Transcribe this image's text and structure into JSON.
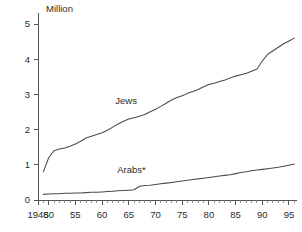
{
  "chart_data": {
    "type": "line",
    "title": "",
    "subtitle": "",
    "unit_label": "Million",
    "xlabel": "",
    "ylabel": "",
    "xlim": [
      1948,
      1996.5
    ],
    "ylim": [
      0,
      5.2
    ],
    "grid": false,
    "legend_position": "inline-annotations",
    "y_ticks": [
      0,
      1,
      2,
      3,
      4,
      5
    ],
    "y_tick_labels": [
      "0",
      "1",
      "2",
      "3",
      "4",
      "5"
    ],
    "x_ticks": [
      1948,
      1950,
      1955,
      1960,
      1965,
      1970,
      1975,
      1980,
      1985,
      1990,
      1995
    ],
    "x_tick_labels": [
      "1948",
      "50",
      "55",
      "60",
      "65",
      "70",
      "75",
      "80",
      "85",
      "90",
      "95"
    ],
    "x_minor_tick_step": 1,
    "series": [
      {
        "name": "Jews",
        "label": "Jews",
        "color": "#4a4a4a",
        "x": [
          1949,
          1950,
          1951,
          1952,
          1953,
          1954,
          1955,
          1956,
          1957,
          1958,
          1959,
          1960,
          1961,
          1962,
          1963,
          1964,
          1965,
          1966,
          1967,
          1968,
          1969,
          1970,
          1971,
          1972,
          1973,
          1974,
          1975,
          1976,
          1977,
          1978,
          1979,
          1980,
          1981,
          1982,
          1983,
          1984,
          1985,
          1986,
          1987,
          1988,
          1989,
          1990,
          1991,
          1992,
          1993,
          1994,
          1995,
          1996
        ],
        "values": [
          0.8,
          1.2,
          1.4,
          1.45,
          1.48,
          1.53,
          1.59,
          1.67,
          1.76,
          1.81,
          1.86,
          1.91,
          1.98,
          2.07,
          2.16,
          2.24,
          2.3,
          2.34,
          2.38,
          2.43,
          2.51,
          2.58,
          2.66,
          2.75,
          2.84,
          2.91,
          2.96,
          3.03,
          3.08,
          3.14,
          3.22,
          3.28,
          3.32,
          3.37,
          3.41,
          3.47,
          3.52,
          3.56,
          3.6,
          3.66,
          3.72,
          3.95,
          4.14,
          4.24,
          4.34,
          4.44,
          4.52,
          4.6
        ]
      },
      {
        "name": "Arabs*",
        "label": "Arabs*",
        "color": "#4a4a4a",
        "x": [
          1949,
          1950,
          1951,
          1952,
          1953,
          1954,
          1955,
          1956,
          1957,
          1958,
          1959,
          1960,
          1961,
          1962,
          1963,
          1964,
          1965,
          1966,
          1967,
          1968,
          1969,
          1970,
          1971,
          1972,
          1973,
          1974,
          1975,
          1976,
          1977,
          1978,
          1979,
          1980,
          1981,
          1982,
          1983,
          1984,
          1985,
          1986,
          1987,
          1988,
          1989,
          1990,
          1991,
          1992,
          1993,
          1994,
          1995,
          1996
        ],
        "values": [
          0.16,
          0.17,
          0.18,
          0.18,
          0.19,
          0.19,
          0.2,
          0.2,
          0.21,
          0.22,
          0.22,
          0.23,
          0.24,
          0.25,
          0.26,
          0.27,
          0.28,
          0.29,
          0.39,
          0.41,
          0.42,
          0.44,
          0.46,
          0.48,
          0.5,
          0.52,
          0.54,
          0.56,
          0.58,
          0.6,
          0.62,
          0.64,
          0.66,
          0.68,
          0.7,
          0.72,
          0.75,
          0.78,
          0.8,
          0.83,
          0.85,
          0.87,
          0.89,
          0.91,
          0.93,
          0.96,
          0.99,
          1.02
        ]
      }
    ],
    "annotations": [
      {
        "text": "Jews",
        "x": 1964.5,
        "y": 2.72
      },
      {
        "text": "Arabs*",
        "x": 1965.5,
        "y": 0.78
      }
    ]
  }
}
